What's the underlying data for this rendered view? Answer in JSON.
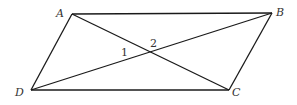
{
  "figure": {
    "type": "parallelogram with diagonals",
    "vertices": {
      "A": {
        "label": "A",
        "x": 72,
        "y": 14,
        "lx": 56,
        "ly": 17
      },
      "B": {
        "label": "B",
        "x": 272,
        "y": 13,
        "lx": 276,
        "ly": 16
      },
      "C": {
        "label": "C",
        "x": 229,
        "y": 90,
        "lx": 232,
        "ly": 96
      },
      "D": {
        "label": "D",
        "x": 31,
        "y": 90,
        "lx": 15,
        "ly": 96
      }
    },
    "intersection": {
      "x": 151,
      "y": 52
    },
    "angles": [
      {
        "label": "1",
        "x": 121,
        "y": 56
      },
      {
        "label": "2",
        "x": 150,
        "y": 47
      }
    ],
    "segments": [
      "AB",
      "BC",
      "CD",
      "DA",
      "AC",
      "DB"
    ],
    "colors": {
      "stroke": "#1a1a1a",
      "text": "#333333",
      "background": "#ffffff"
    }
  }
}
